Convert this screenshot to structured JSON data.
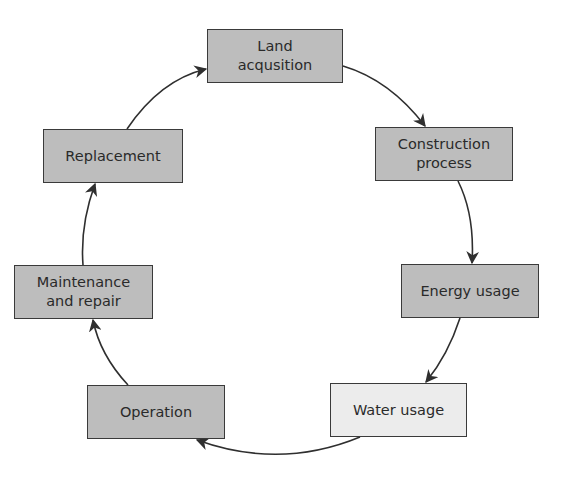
{
  "diagram": {
    "type": "cycle",
    "colors": {
      "box_fill": "#bdbdbd",
      "box_fill_highlight": "#ececec",
      "border": "#3a3a3a",
      "arrow": "#2f2f2f"
    },
    "nodes": [
      {
        "id": "land",
        "label": "Land\nacqusition",
        "x": 207,
        "y": 29,
        "w": 136,
        "h": 54,
        "fill": "#bdbdbd"
      },
      {
        "id": "construction",
        "label": "Construction\nprocess",
        "x": 375,
        "y": 127,
        "w": 138,
        "h": 54,
        "fill": "#bdbdbd"
      },
      {
        "id": "energy",
        "label": "Energy usage",
        "x": 401,
        "y": 264,
        "w": 138,
        "h": 54,
        "fill": "#bdbdbd"
      },
      {
        "id": "water",
        "label": "Water usage",
        "x": 330,
        "y": 383,
        "w": 137,
        "h": 54,
        "fill": "#ececec"
      },
      {
        "id": "operation",
        "label": "Operation",
        "x": 87,
        "y": 385,
        "w": 138,
        "h": 54,
        "fill": "#bdbdbd"
      },
      {
        "id": "maintenance",
        "label": "Maintenance\nand repair",
        "x": 14,
        "y": 265,
        "w": 139,
        "h": 54,
        "fill": "#bdbdbd"
      },
      {
        "id": "replacement",
        "label": "Replacement",
        "x": 43,
        "y": 129,
        "w": 140,
        "h": 54,
        "fill": "#bdbdbd"
      }
    ],
    "edges": [
      {
        "from": "land",
        "to": "construction",
        "path": "M343,66 Q390,80 425,126"
      },
      {
        "from": "construction",
        "to": "energy",
        "path": "M458,181 Q475,215 472,263"
      },
      {
        "from": "energy",
        "to": "water",
        "path": "M460,318 Q448,355 426,382"
      },
      {
        "from": "water",
        "to": "operation",
        "path": "M360,437 Q280,470 197,440"
      },
      {
        "from": "operation",
        "to": "maintenance",
        "path": "M128,385 Q100,355 93,320"
      },
      {
        "from": "maintenance",
        "to": "replacement",
        "path": "M83,265 Q80,225 95,184"
      },
      {
        "from": "replacement",
        "to": "land",
        "path": "M127,129 Q160,80 206,69"
      }
    ]
  }
}
